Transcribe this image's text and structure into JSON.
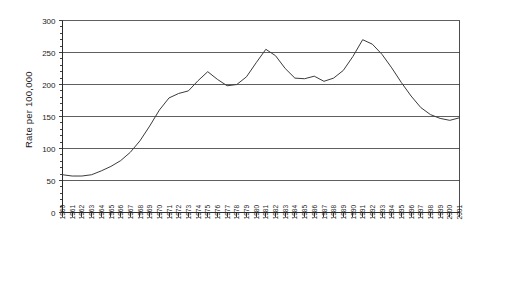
{
  "chart_data": {
    "type": "line",
    "title": "",
    "xlabel": "",
    "ylabel": "Rate per 100,000",
    "ylim": [
      0,
      300
    ],
    "ytick_labels": [
      "0",
      "50",
      "100",
      "150",
      "200",
      "250",
      "300"
    ],
    "ytick_values": [
      0,
      50,
      100,
      150,
      200,
      250,
      300
    ],
    "grid": true,
    "legend": "none",
    "x": [
      "1960",
      "1961",
      "1962",
      "1963",
      "1964",
      "1965",
      "1966",
      "1967",
      "1968",
      "1969",
      "1970",
      "1971",
      "1972",
      "1973",
      "1974",
      "1975",
      "1976",
      "1977",
      "1978",
      "1979",
      "1980",
      "1981",
      "1982",
      "1983",
      "1984",
      "1985",
      "1986",
      "1987",
      "1988",
      "1989",
      "1990",
      "1991",
      "1992",
      "1993",
      "1994",
      "1995",
      "1996",
      "1997",
      "1998",
      "1999",
      "2000",
      "2001"
    ],
    "series": [
      {
        "name": "Rate per 100,000",
        "values": [
          59,
          57,
          57,
          59,
          65,
          72,
          81,
          94,
          112,
          135,
          160,
          179,
          186,
          190,
          206,
          220,
          208,
          198,
          200,
          212,
          234,
          255,
          245,
          225,
          210,
          209,
          213,
          205,
          210,
          222,
          244,
          270,
          263,
          247,
          226,
          203,
          182,
          164,
          153,
          147,
          144,
          148
        ]
      }
    ]
  }
}
